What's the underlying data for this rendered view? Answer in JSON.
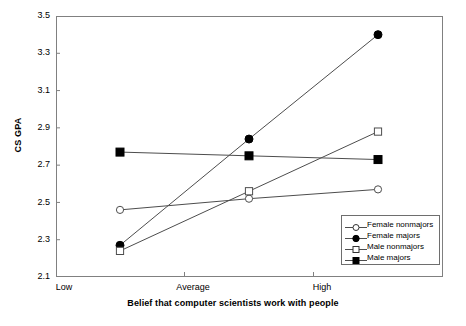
{
  "chart_data": {
    "type": "line",
    "title": "",
    "xlabel": "Belief that computer scientists work with people",
    "ylabel": "CS GPA",
    "categories": [
      "Low",
      "Average",
      "High"
    ],
    "ylim": [
      2.1,
      3.5
    ],
    "yticks": [
      "2.1",
      "2.3",
      "2.5",
      "2.7",
      "2.9",
      "3.1",
      "3.3",
      "3.5"
    ],
    "grid": false,
    "legend_position": "lower-right",
    "series": [
      {
        "name": "Female nonmajors",
        "marker": "open-circle",
        "values": [
          2.46,
          2.52,
          2.57
        ]
      },
      {
        "name": "Female majors",
        "marker": "filled-circle",
        "values": [
          2.27,
          2.84,
          3.4
        ]
      },
      {
        "name": "Male nonmajors",
        "marker": "open-square",
        "values": [
          2.24,
          2.56,
          2.88
        ]
      },
      {
        "name": "Male majors",
        "marker": "filled-square",
        "values": [
          2.77,
          2.75,
          2.73
        ]
      }
    ],
    "colors": {
      "line": "#4d4d4d",
      "marker_fill": "#000000",
      "marker_stroke": "#000000",
      "axis": "#808080",
      "background": "#ffffff"
    }
  }
}
